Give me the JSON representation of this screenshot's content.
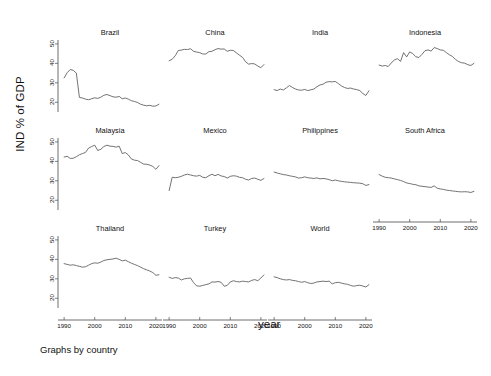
{
  "figure": {
    "ylabel": "IND % of GDP",
    "xlabel": "year",
    "caption": "Graphs by country"
  },
  "chart_data": {
    "type": "line",
    "title": "",
    "xlabel": "year",
    "ylabel": "IND % of GDP",
    "xlim": [
      1988,
      2022
    ],
    "ylim": [
      15,
      52
    ],
    "yticks": [
      20,
      30,
      40,
      50
    ],
    "xticks": [
      1990,
      2000,
      2010,
      2020
    ],
    "grid": false,
    "legend": null,
    "layout": {
      "rows": 3,
      "cols": 4,
      "shared_y": true,
      "shared_x": true,
      "by": "country"
    },
    "x": [
      1990,
      1991,
      1992,
      1993,
      1994,
      1995,
      1996,
      1997,
      1998,
      1999,
      2000,
      2001,
      2002,
      2003,
      2004,
      2005,
      2006,
      2007,
      2008,
      2009,
      2010,
      2011,
      2012,
      2013,
      2014,
      2015,
      2016,
      2017,
      2018,
      2019,
      2020,
      2021
    ],
    "series": [
      {
        "name": "Brazil",
        "panel": 0,
        "values": [
          32.5,
          35.2,
          36.8,
          36.4,
          35.0,
          22.5,
          22.2,
          21.6,
          21.3,
          21.8,
          22.3,
          22.0,
          22.6,
          23.6,
          24.0,
          23.4,
          22.8,
          22.6,
          23.0,
          21.8,
          22.2,
          21.6,
          20.8,
          20.4,
          19.9,
          19.0,
          18.5,
          18.2,
          18.4,
          18.0,
          18.1,
          19.0
        ]
      },
      {
        "name": "China",
        "panel": 1,
        "values": [
          41.3,
          42.1,
          43.9,
          46.6,
          46.8,
          47.2,
          47.1,
          47.5,
          46.2,
          45.8,
          45.5,
          44.8,
          44.8,
          46.0,
          46.2,
          47.0,
          47.6,
          47.3,
          47.4,
          46.2,
          46.7,
          46.6,
          45.4,
          44.2,
          43.1,
          40.8,
          39.6,
          39.9,
          39.7,
          38.6,
          37.8,
          39.4
        ]
      },
      {
        "name": "India",
        "panel": 2,
        "values": [
          26.5,
          26.0,
          26.8,
          26.3,
          27.4,
          28.6,
          27.6,
          26.8,
          26.3,
          26.2,
          26.6,
          26.0,
          26.4,
          26.8,
          28.0,
          28.9,
          29.3,
          30.3,
          30.6,
          30.5,
          30.7,
          29.6,
          28.4,
          27.6,
          27.1,
          27.3,
          26.8,
          26.5,
          26.0,
          24.5,
          23.5,
          25.9
        ]
      },
      {
        "name": "Indonesia",
        "panel": 3,
        "values": [
          39.1,
          38.6,
          38.9,
          38.4,
          40.2,
          41.8,
          42.4,
          41.0,
          45.5,
          43.3,
          45.9,
          45.0,
          43.4,
          43.0,
          44.6,
          46.5,
          46.9,
          46.3,
          48.1,
          47.6,
          46.9,
          46.7,
          45.5,
          44.4,
          43.5,
          42.0,
          40.9,
          40.3,
          40.1,
          39.3,
          38.9,
          40.0
        ]
      },
      {
        "name": "Malaysia",
        "panel": 4,
        "values": [
          42.2,
          42.6,
          41.5,
          41.6,
          42.4,
          43.4,
          44.0,
          44.6,
          46.8,
          47.6,
          48.3,
          45.6,
          46.2,
          47.6,
          48.3,
          47.8,
          47.7,
          47.3,
          47.8,
          44.0,
          44.5,
          43.3,
          41.2,
          40.6,
          40.4,
          39.5,
          38.6,
          38.5,
          38.1,
          37.4,
          35.9,
          37.8
        ]
      },
      {
        "name": "Mexico",
        "panel": 5,
        "values": [
          25.0,
          31.8,
          31.6,
          31.8,
          32.3,
          33.0,
          33.4,
          33.0,
          32.6,
          32.4,
          32.8,
          31.8,
          31.6,
          32.6,
          33.4,
          32.6,
          33.3,
          32.5,
          32.2,
          31.4,
          32.3,
          32.6,
          32.4,
          31.8,
          31.6,
          30.8,
          30.4,
          31.2,
          31.4,
          30.8,
          30.2,
          31.2
        ]
      },
      {
        "name": "Philippines",
        "panel": 6,
        "values": [
          34.5,
          34.0,
          33.6,
          33.2,
          33.0,
          32.6,
          32.3,
          32.0,
          31.4,
          31.6,
          32.0,
          31.6,
          31.4,
          31.2,
          31.5,
          31.0,
          31.2,
          31.0,
          30.6,
          30.0,
          30.4,
          30.0,
          29.7,
          29.5,
          29.3,
          29.2,
          29.0,
          28.9,
          28.8,
          28.5,
          27.6,
          28.1
        ]
      },
      {
        "name": "South Africa",
        "panel": 7,
        "values": [
          33.2,
          32.4,
          31.8,
          31.6,
          31.4,
          31.0,
          30.6,
          30.2,
          29.6,
          28.9,
          28.6,
          28.2,
          28.0,
          27.4,
          27.2,
          27.0,
          26.8,
          26.6,
          27.4,
          26.2,
          25.8,
          25.6,
          25.2,
          25.0,
          24.8,
          24.6,
          24.4,
          24.3,
          24.4,
          24.3,
          24.0,
          24.6
        ]
      },
      {
        "name": "Thailand",
        "panel": 8,
        "values": [
          37.8,
          37.4,
          37.0,
          37.2,
          36.8,
          36.4,
          36.0,
          36.2,
          37.0,
          37.8,
          38.2,
          38.0,
          38.6,
          39.4,
          39.8,
          40.0,
          40.2,
          40.6,
          40.0,
          39.2,
          39.6,
          38.8,
          38.0,
          37.4,
          36.8,
          36.0,
          35.2,
          34.6,
          34.0,
          33.2,
          31.8,
          32.1
        ]
      },
      {
        "name": "Turkey",
        "panel": 9,
        "values": [
          30.8,
          30.2,
          30.6,
          30.4,
          29.4,
          30.0,
          30.2,
          30.4,
          28.0,
          26.4,
          26.2,
          26.6,
          27.0,
          27.4,
          28.4,
          28.3,
          28.6,
          28.2,
          26.2,
          26.6,
          28.4,
          29.0,
          28.6,
          28.4,
          28.8,
          28.6,
          28.4,
          29.2,
          29.6,
          29.0,
          30.4,
          32.0
        ]
      },
      {
        "name": "World",
        "panel": 10,
        "values": [
          31.0,
          30.6,
          30.0,
          29.6,
          29.4,
          29.6,
          29.2,
          29.0,
          28.6,
          28.2,
          28.6,
          28.0,
          27.6,
          27.8,
          28.4,
          28.6,
          28.8,
          28.6,
          28.8,
          27.4,
          28.0,
          28.2,
          27.8,
          27.4,
          27.2,
          26.6,
          26.2,
          26.5,
          26.7,
          26.3,
          25.8,
          27.0
        ]
      }
    ]
  },
  "panels": [
    {
      "title": "Brazil"
    },
    {
      "title": "China"
    },
    {
      "title": "India"
    },
    {
      "title": "Indonesia"
    },
    {
      "title": "Malaysia"
    },
    {
      "title": "Mexico"
    },
    {
      "title": "Philippines"
    },
    {
      "title": "South Africa"
    },
    {
      "title": "Thailand"
    },
    {
      "title": "Turkey"
    },
    {
      "title": "World"
    }
  ],
  "axis": {
    "ytick_labels": [
      "50",
      "40",
      "30",
      "20"
    ],
    "xtick_labels": [
      "1990",
      "2000",
      "2010",
      "2020"
    ]
  }
}
